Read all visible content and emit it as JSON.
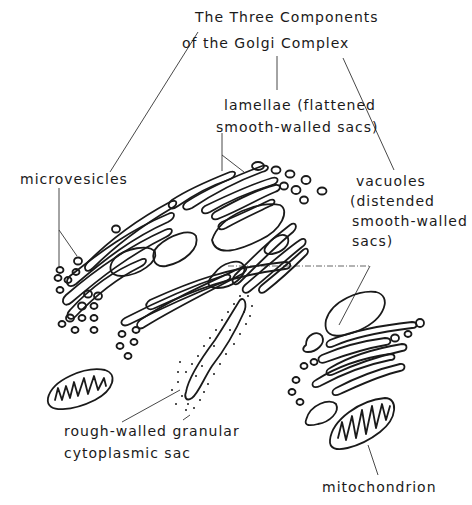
{
  "figure": {
    "title_line1": "The Three Components",
    "title_line2": "of the Golgi Complex",
    "labels": {
      "lamellae_line1": "lamellae (flattened",
      "lamellae_line2": "smooth-walled sacs)",
      "microvesicles": "microvesicles",
      "vacuoles_line1": "vacuoles",
      "vacuoles_line2": "(distended",
      "vacuoles_line3": "smooth-walled",
      "vacuoles_line4": "sacs)",
      "rough_line1": "rough-walled granular",
      "rough_line2": "cytoplasmic  sac",
      "mitochondrion": "mitochondrion"
    },
    "line_color": "#1a1a1a",
    "background": "#ffffff"
  }
}
